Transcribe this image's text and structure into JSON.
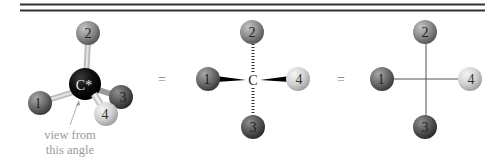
{
  "figure": {
    "left": {
      "center_label": "C*",
      "spheres": [
        {
          "id": "1",
          "label": "1"
        },
        {
          "id": "2",
          "label": "2"
        },
        {
          "id": "3",
          "label": "3"
        },
        {
          "id": "4",
          "label": "4"
        }
      ],
      "annotation_line1": "view from",
      "annotation_line2": "this angle"
    },
    "equals1": "=",
    "middle": {
      "center_label": "C",
      "spheres": [
        {
          "id": "1",
          "label": "1"
        },
        {
          "id": "2",
          "label": "2"
        },
        {
          "id": "3",
          "label": "3"
        },
        {
          "id": "4",
          "label": "4"
        }
      ]
    },
    "equals2": "=",
    "right": {
      "spheres": [
        {
          "id": "1",
          "label": "1"
        },
        {
          "id": "2",
          "label": "2"
        },
        {
          "id": "3",
          "label": "3"
        },
        {
          "id": "4",
          "label": "4"
        }
      ]
    },
    "colors": {
      "sphere1": "#6e6e6e",
      "sphere2": "#8c8c8c",
      "sphere3": "#5a5a5a",
      "sphere4": "#d4d4d4",
      "carbon": "#0c0c0c",
      "bond": "#c8c8c8",
      "annotation": "#9a9a9a"
    }
  }
}
